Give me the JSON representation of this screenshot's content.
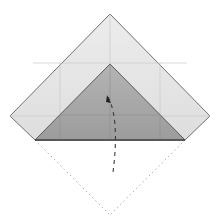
{
  "diagram": {
    "type": "origami-fold-step",
    "colors": {
      "background": "#ffffff",
      "paper_light": "#e6e6e6",
      "paper_dark": "#a9a9a9",
      "edge": "#707070",
      "crease": "#c8c8c8",
      "dotted_outline": "#b0b0b0",
      "arrow": "#3a3a3a"
    },
    "shapes": {
      "outer_paper": "110,14 210,116 185,140 35,140 10,116",
      "inner_flap": "110,64 185,140 35,140",
      "dotted_left": "35,140 110,215",
      "dotted_right": "185,140 110,215"
    },
    "arrow": {
      "path": "M108,97 C118,115 116,150 113,172",
      "style": "dashed",
      "direction": "fold-down"
    },
    "creases": [
      {
        "x1": 33,
        "y1": 63,
        "x2": 187,
        "y2": 63
      },
      {
        "x1": 10,
        "y1": 116,
        "x2": 210,
        "y2": 116
      },
      {
        "x1": 60,
        "y1": 63,
        "x2": 60,
        "y2": 140
      },
      {
        "x1": 160,
        "y1": 63,
        "x2": 160,
        "y2": 140
      },
      {
        "x1": 110,
        "y1": 14,
        "x2": 110,
        "y2": 140
      }
    ]
  }
}
